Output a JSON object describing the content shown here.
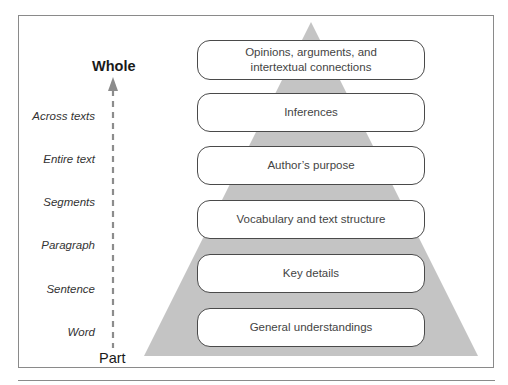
{
  "diagram": {
    "axis": {
      "top_label": "Whole",
      "bottom_label": "Part",
      "arrow_color": "#8c8c8c"
    },
    "levels": [
      {
        "label": "Across texts"
      },
      {
        "label": "Entire text"
      },
      {
        "label": "Segments"
      },
      {
        "label": "Paragraph"
      },
      {
        "label": "Sentence"
      },
      {
        "label": "Word"
      }
    ],
    "pyramid": {
      "fill_color": "#c4c4c4",
      "tiers": [
        {
          "label_line1": "Opinions, arguments, and",
          "label_line2": "intertextual connections"
        },
        {
          "label_line1": "Inferences"
        },
        {
          "label_line1": "Author’s purpose"
        },
        {
          "label_line1": "Vocabulary and text structure"
        },
        {
          "label_line1": "Key details"
        },
        {
          "label_line1": "General understandings"
        }
      ]
    }
  }
}
